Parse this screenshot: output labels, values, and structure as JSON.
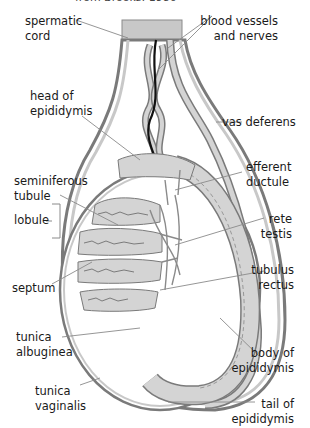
{
  "caption": "from Brooks: 1980",
  "labels": {
    "spermatic_cord": "spermatic\ncord",
    "blood_vessels": "blood vessels\nand nerves",
    "head_of_epididymis": "head of\nepididymis",
    "vas_deferens": "vas deferens",
    "efferent_ductule": "efferent\nductule",
    "seminiferous_tubule": "seminiferous\ntubule",
    "rete_testis": "rete\ntestis",
    "lobule": "lobule",
    "tubulus_rectus": "tubulus\nrectus",
    "septum": "septum",
    "tunica_albuginea": "tunica\nalbuginea",
    "body_of_epididymis": "body of\nepididymis",
    "tunica_vaginalis": "tunica\nvaginalis",
    "tail_of_epididymis": "tail of\nepididymis"
  },
  "colors": {
    "outline": "#7a7a7a",
    "fill_gray": "#c8c8c8",
    "tissue": "#d4d4d4",
    "nerve": "#111111",
    "leader": "#8a8a8a"
  }
}
